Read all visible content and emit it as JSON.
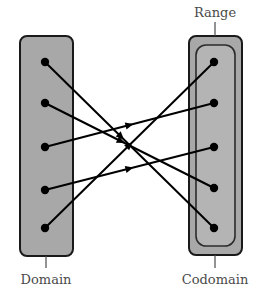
{
  "diagram": {
    "title_labels": {
      "domain": "Domain",
      "codomain": "Codomain",
      "range": "Range"
    },
    "colors": {
      "box_fill": "#a8a8a8",
      "box_stroke": "#1a1a1a",
      "inner_fill": "#b4b4b4",
      "inner_stroke": "#2b2b2b",
      "dot_fill": "#000000",
      "arrow_stroke": "#000000",
      "label_color": "#4a4a4a",
      "leader_color": "#4a4a4a",
      "background": "#ffffff"
    },
    "domain_box": {
      "x": 20,
      "y": 36,
      "width": 53,
      "height": 220,
      "rx": 7
    },
    "codomain_box": {
      "x": 189,
      "y": 36,
      "width": 53,
      "height": 219,
      "rx": 7
    },
    "range_box": {
      "x": 196,
      "y": 45,
      "width": 39,
      "height": 201,
      "rx": 10
    },
    "domain_points": [
      {
        "id": "d1",
        "x": 45,
        "y": 62
      },
      {
        "id": "d2",
        "x": 45,
        "y": 103
      },
      {
        "id": "d3",
        "x": 45,
        "y": 147
      },
      {
        "id": "d4",
        "x": 45,
        "y": 190
      },
      {
        "id": "d5",
        "x": 45,
        "y": 228
      }
    ],
    "codomain_points": [
      {
        "id": "c1",
        "x": 214,
        "y": 62
      },
      {
        "id": "c2",
        "x": 214,
        "y": 103
      },
      {
        "id": "c3",
        "x": 214,
        "y": 147
      },
      {
        "id": "c4",
        "x": 214,
        "y": 188
      },
      {
        "id": "c5",
        "x": 214,
        "y": 228
      }
    ],
    "mappings": [
      {
        "from": "d1",
        "to": "c5",
        "arrow_t": 0.45
      },
      {
        "from": "d2",
        "to": "c4",
        "arrow_t": 0.45
      },
      {
        "from": "d3",
        "to": "c2",
        "arrow_t": 0.5
      },
      {
        "from": "d4",
        "to": "c3",
        "arrow_t": 0.5
      },
      {
        "from": "d5",
        "to": "c1",
        "arrow_t": 0.5
      }
    ],
    "leaders": {
      "domain": {
        "x": 46,
        "y1": 256,
        "y2": 268
      },
      "codomain": {
        "x": 215,
        "y1": 255,
        "y2": 268
      },
      "range": {
        "x": 215,
        "y1": 22,
        "y2": 36
      }
    },
    "label_positions": {
      "domain": {
        "x": 46,
        "y": 284
      },
      "codomain": {
        "x": 215,
        "y": 284
      },
      "range": {
        "x": 215,
        "y": 17
      }
    }
  }
}
